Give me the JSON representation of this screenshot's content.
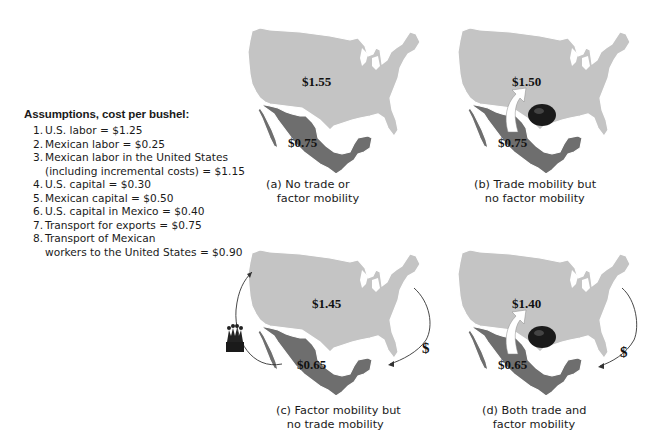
{
  "assumptions": {
    "title": "Assumptions, cost per bushel:",
    "items": [
      {
        "num": "1.",
        "text": "U.S. labor = $1.25"
      },
      {
        "num": "2.",
        "text": "Mexican labor = $0.25"
      },
      {
        "num": "3.",
        "text": "Mexican labor in the United States"
      },
      {
        "num": "",
        "text": "(including incremental costs) = $1.15"
      },
      {
        "num": "4.",
        "text": "U.S. capital = $0.30"
      },
      {
        "num": "5.",
        "text": "Mexican capital = $0.50"
      },
      {
        "num": "6.",
        "text": "U.S. capital in Mexico = $0.40"
      },
      {
        "num": "7.",
        "text": "Transport for exports = $0.75"
      },
      {
        "num": "8.",
        "text": "Transport of Mexican"
      },
      {
        "num": "",
        "text": "workers to the United States = $0.90"
      }
    ]
  },
  "colors": {
    "us_fill": "#c4c4c4",
    "mexico_fill": "#6e6e6e",
    "border": "#ffffff",
    "arrow_fill": "#ffffff",
    "text": "#111111"
  },
  "panels": [
    {
      "id": "a",
      "us_price": "$1.55",
      "mexico_price": "$0.75",
      "caption_line1": "(a) No trade or",
      "caption_line2": "factor mobility",
      "trade_arrow": false,
      "factor_arrows": false
    },
    {
      "id": "b",
      "us_price": "$1.50",
      "mexico_price": "$0.75",
      "caption_line1": "(b) Trade mobility but",
      "caption_line2": "no factor mobility",
      "trade_arrow": true,
      "factor_arrows": false
    },
    {
      "id": "c",
      "us_price": "$1.45",
      "mexico_price": "$0.65",
      "caption_line1": "(c) Factor mobility but",
      "caption_line2": "no trade mobility",
      "trade_arrow": false,
      "factor_arrows": true,
      "capital_symbol": "$"
    },
    {
      "id": "d",
      "us_price": "$1.40",
      "mexico_price": "$0.65",
      "caption_line1": "(d) Both trade and",
      "caption_line2": "factor mobility",
      "trade_arrow": true,
      "factor_arrows": true,
      "capital_symbol": "$"
    }
  ]
}
